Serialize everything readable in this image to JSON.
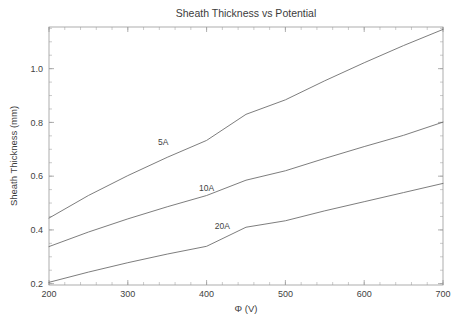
{
  "chart_data": {
    "type": "line",
    "title": "Sheath Thickness vs Potential",
    "xlabel": "Φ (V)",
    "ylabel": "Sheath Thickness (mm)",
    "xlim": [
      200,
      700
    ],
    "ylim": [
      0.195,
      1.155
    ],
    "grid": false,
    "legend": "inline-curve-labels",
    "xticks": [
      200,
      300,
      400,
      500,
      600,
      700
    ],
    "xticklabels": [
      "200",
      "300",
      "400",
      "500",
      "600",
      "700"
    ],
    "yticks": [
      0.2,
      0.4,
      0.6,
      0.8,
      1.0
    ],
    "yticklabels": [
      "0.2",
      "0.4",
      "0.6",
      "0.8",
      "1.0"
    ],
    "x_minor_step": 20,
    "y_minor_step": 0.05,
    "x": [
      200,
      250,
      300,
      350,
      400,
      450,
      500,
      550,
      600,
      650,
      700
    ],
    "series": [
      {
        "name": "5A",
        "label": "5A",
        "values": [
          0.444,
          0.528,
          0.602,
          0.67,
          0.733,
          0.83,
          0.884,
          0.955,
          1.022,
          1.086,
          1.146
        ],
        "color": "#6e6e6e",
        "label_x": 345,
        "label_y": 0.715
      },
      {
        "name": "10A",
        "label": "10A",
        "values": [
          0.338,
          0.392,
          0.441,
          0.486,
          0.528,
          0.585,
          0.62,
          0.666,
          0.71,
          0.752,
          0.801
        ],
        "color": "#6e6e6e",
        "label_x": 400,
        "label_y": 0.545
      },
      {
        "name": "20A",
        "label": "20A",
        "values": [
          0.205,
          0.243,
          0.278,
          0.31,
          0.339,
          0.41,
          0.434,
          0.471,
          0.505,
          0.539,
          0.573
        ],
        "color": "#6e6e6e",
        "label_x": 420,
        "label_y": 0.403
      }
    ]
  },
  "axes_colors": {
    "frame": "#9a9a9a",
    "text": "#3c3c3c",
    "curve": "#6e6e6e",
    "background": "#ffffff"
  }
}
